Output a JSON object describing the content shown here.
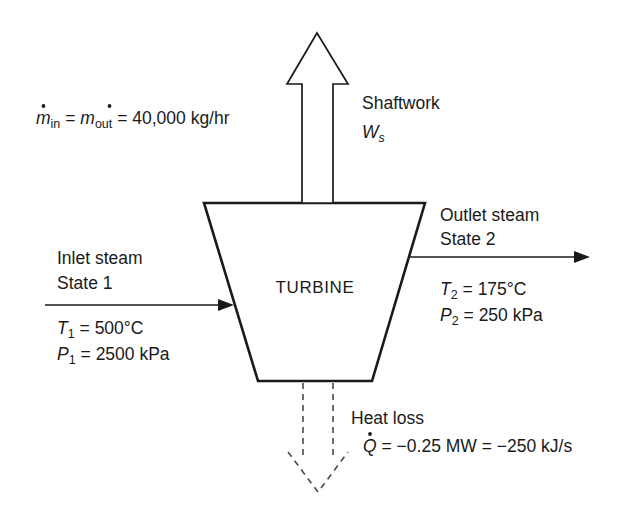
{
  "diagram": {
    "body_label": "TURBINE",
    "colors": {
      "stroke": "#1a1a1a",
      "dashed_stroke": "#4a4a4a",
      "background": "#ffffff"
    }
  },
  "mass_balance": {
    "symbol_m": "m",
    "sub_in": "in",
    "sub_out": "out",
    "eq1": "=",
    "eq2": "=",
    "value": "40,000 kg/hr",
    "full_text": "ṁin = ṁout = 40,000 kg/hr"
  },
  "shaftwork": {
    "label": "Shaftwork",
    "symbol": "W",
    "subscript": "s",
    "full_text": "Shaftwork Ws"
  },
  "inlet": {
    "line1": "Inlet steam",
    "line2": "State 1",
    "temperature": {
      "symbol": "T",
      "subscript": "1",
      "equals": "=",
      "value": "500°C"
    },
    "pressure": {
      "symbol": "P",
      "subscript": "1",
      "equals": "=",
      "value": "2500 kPa"
    }
  },
  "outlet": {
    "line1": "Outlet steam",
    "line2": "State 2",
    "temperature": {
      "symbol": "T",
      "subscript": "2",
      "equals": "=",
      "value": "175°C"
    },
    "pressure": {
      "symbol": "P",
      "subscript": "2",
      "equals": "=",
      "value": "250 kPa"
    }
  },
  "heat_loss": {
    "label": "Heat loss",
    "symbol": "Q",
    "equals": "=",
    "value_mw": "−0.25 MW",
    "equals2": "=",
    "value_kjs": "−250 kJ/s",
    "full_text": "Q̇ = −0.25 MW = −250 kJ/s"
  }
}
